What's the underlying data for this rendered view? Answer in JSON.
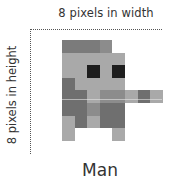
{
  "labels": {
    "width": "8 pixels  in width",
    "height": "8 pixels in height",
    "caption": "Man"
  },
  "palette": {
    "W": "#ffffff",
    "L": "#a9a9a9",
    "M": "#8c8c8c",
    "D": "#6f6f6f",
    "H": "#7b7b7b",
    "K": "#1e1e1e"
  },
  "grid": [
    [
      "H",
      "H",
      "H",
      "M",
      "W",
      "W",
      "W",
      "W"
    ],
    [
      "L",
      "L",
      "L",
      "L",
      "L",
      "W",
      "W",
      "W"
    ],
    [
      "L",
      "L",
      "K",
      "L",
      "K",
      "W",
      "W",
      "W"
    ],
    [
      "D",
      "L",
      "L",
      "L",
      "L",
      "W",
      "W",
      "W"
    ],
    [
      "D",
      "D",
      "L",
      "M",
      "M",
      "L",
      "D",
      "L"
    ],
    [
      "D",
      "D",
      "M",
      "D",
      "D",
      "W",
      "W",
      "W"
    ],
    [
      "L",
      "D",
      "L",
      "D",
      "D",
      "W",
      "W",
      "W"
    ],
    [
      "L",
      "W",
      "W",
      "W",
      "L",
      "W",
      "W",
      "W"
    ]
  ]
}
